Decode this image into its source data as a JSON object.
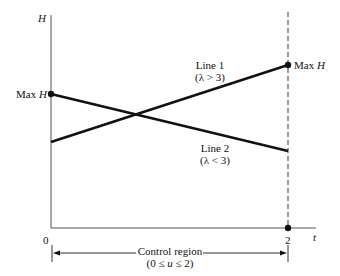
{
  "axes": {
    "y_label": "H",
    "x_label": "t",
    "x_origin_label": "0",
    "x_end_label": "2"
  },
  "markers": {
    "left_max": {
      "prefix": "Max",
      "var": "H"
    },
    "right_max": {
      "prefix": "Max",
      "var": "H"
    }
  },
  "lines": [
    {
      "name": "Line 1",
      "condition": "(λ > 3)",
      "from": [
        0,
        "low"
      ],
      "to": [
        2,
        "Max H"
      ]
    },
    {
      "name": "Line 2",
      "condition": "(λ < 3)",
      "from": [
        0,
        "Max H"
      ],
      "to": [
        2,
        "low"
      ]
    }
  ],
  "control_region": {
    "title": "Control region",
    "range": "(0 ≤ u ≤ 2)",
    "range_parts": {
      "open": "(0 ≤ ",
      "var": "u",
      "close": " ≤ 2)"
    }
  },
  "colors": {
    "ink": "#111111",
    "axis": "#555555",
    "background": "#ffffff"
  }
}
